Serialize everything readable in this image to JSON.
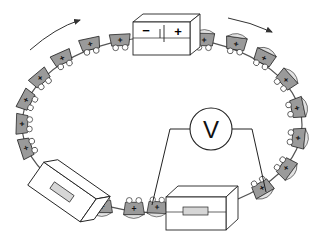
{
  "diagram": {
    "type": "cart-loop-mechanism",
    "battery": {
      "negative_label": "−",
      "positive_label": "+"
    },
    "voltmeter": {
      "label": "V"
    },
    "cart_symbol": "+",
    "arrows": [
      "clockwise-left",
      "clockwise-right"
    ],
    "colors": {
      "cart_fill": "#9a9a9a",
      "cart_load": "#e2e2e2",
      "outline": "#222222",
      "wheel": "#ffffff",
      "box_fill": "#ffffff",
      "slot_fill": "#d6d6d6"
    }
  }
}
